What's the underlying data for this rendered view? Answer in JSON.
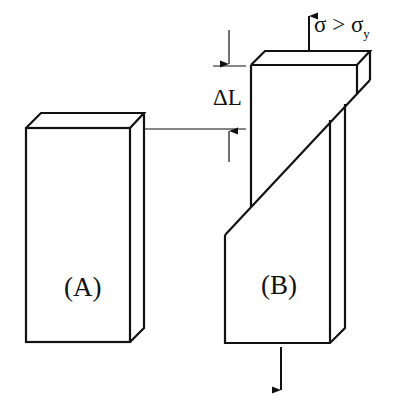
{
  "figure": {
    "specimen_a": {
      "label": "(A)"
    },
    "specimen_b": {
      "label": "(B)"
    },
    "elongation": {
      "label": "ΔL"
    },
    "stress_condition": {
      "sigma": "σ",
      "operator": ">",
      "sigma_y": "σ",
      "subscript": "y"
    },
    "colors": {
      "line": "#111111",
      "background": "#ffffff"
    }
  }
}
